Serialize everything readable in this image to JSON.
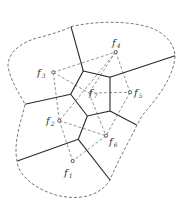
{
  "colors": {
    "line": "#2a2a2a",
    "dashed": "#555555",
    "background": "#ffffff"
  },
  "sites": [
    {
      "id": "f1",
      "base": "f",
      "sub": "1",
      "x": 72.7,
      "y": 161,
      "lx": 64,
      "ly": 176
    },
    {
      "id": "f2",
      "base": "f",
      "sub": "2",
      "x": 59.3,
      "y": 120.7,
      "lx": 46,
      "ly": 124
    },
    {
      "id": "f3",
      "base": "f",
      "sub": "3",
      "x": 53.3,
      "y": 72.3,
      "lx": 37,
      "ly": 76
    },
    {
      "id": "f4",
      "base": "f",
      "sub": "4",
      "x": 115.7,
      "y": 52,
      "lx": 112,
      "ly": 46
    },
    {
      "id": "f5",
      "base": "f",
      "sub": "5",
      "x": 130,
      "y": 92.3,
      "lx": 134,
      "ly": 96
    },
    {
      "id": "f6",
      "base": "f",
      "sub": "6",
      "x": 106,
      "y": 135.7,
      "lx": 109,
      "ly": 145
    },
    {
      "id": "f7",
      "base": "f",
      "sub": "7",
      "x": 89,
      "y": 93,
      "lx": 89,
      "ly": 96
    }
  ],
  "labels": {
    "f1": "f",
    "f1_sub": "1",
    "f2": "f",
    "f2_sub": "2",
    "f3": "f",
    "f3_sub": "3",
    "f4": "f",
    "f4_sub": "4",
    "f5": "f",
    "f5_sub": "5",
    "f6": "f",
    "f6_sub": "6",
    "f7": "f",
    "f7_sub": "7"
  }
}
